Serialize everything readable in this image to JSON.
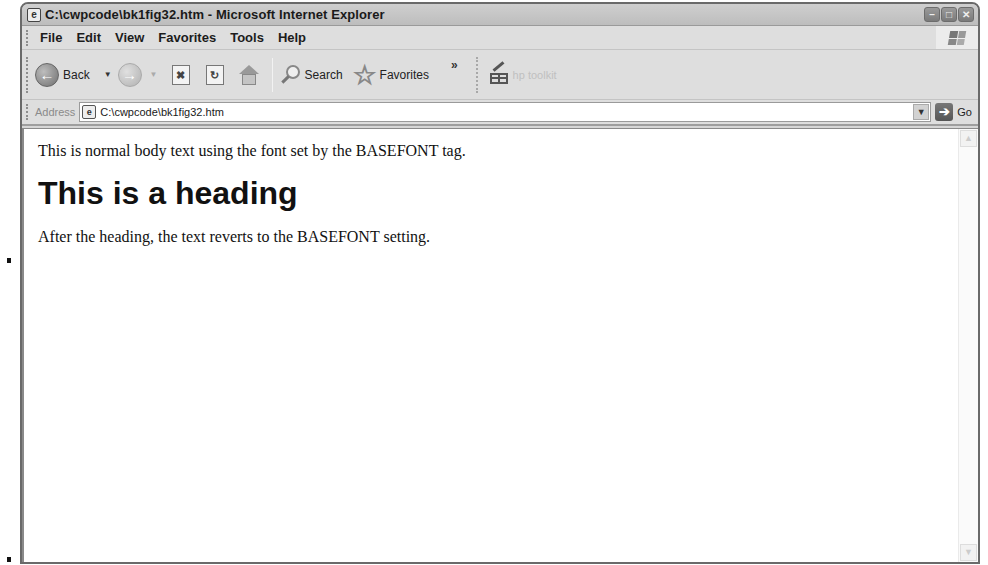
{
  "window": {
    "title": "C:\\cwpcode\\bk1fig32.htm - Microsoft Internet Explorer",
    "controls": {
      "minimize": "–",
      "maximize": "□",
      "close": "✕"
    }
  },
  "menubar": {
    "items": [
      "File",
      "Edit",
      "View",
      "Favorites",
      "Tools",
      "Help"
    ]
  },
  "toolbar": {
    "back_label": "Back",
    "search_label": "Search",
    "favorites_label": "Favorites",
    "overflow_label": "»",
    "hp_toolkit_label": "hp toolkit"
  },
  "addressbar": {
    "label": "Address",
    "value": "C:\\cwpcode\\bk1fig32.htm",
    "go_label": "Go"
  },
  "page": {
    "paragraph_1": "This is normal body text using the font set by the BASEFONT tag.",
    "heading": "This is a heading",
    "paragraph_2": "After the heading, the text reverts to the BASEFONT setting."
  },
  "icons": {
    "page_glyph": "e",
    "back_arrow": "←",
    "forward_arrow": "→",
    "stop_glyph": "✖",
    "refresh_glyph": "↻",
    "star_glyph": "☆",
    "dropdown_glyph": "▼",
    "go_arrow": "➔",
    "scroll_up": "▲",
    "scroll_down": "▼"
  }
}
